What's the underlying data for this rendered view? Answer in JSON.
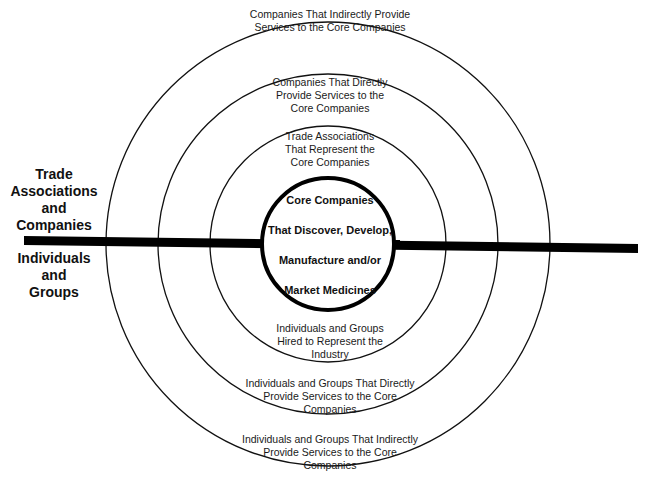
{
  "diagram": {
    "type": "concentric-circles",
    "center": [
      328,
      243
    ],
    "rings": [
      {
        "name": "outer",
        "radius": 222,
        "stroke": "#111111",
        "width": 1.3
      },
      {
        "name": "middle",
        "radius": 170,
        "stroke": "#111111",
        "width": 1.3
      },
      {
        "name": "inner",
        "radius": 118,
        "stroke": "#111111",
        "width": 1.3
      },
      {
        "name": "core",
        "radius": 66,
        "stroke": "#000000",
        "width": 4
      }
    ],
    "divider": {
      "x1": 24,
      "y1": 240,
      "x2": 638,
      "y2": 249,
      "stroke": "#000000",
      "width": 8
    },
    "core": {
      "lines": [
        "Core Companies",
        "That Discover, Develop,",
        "Manufacture and/or",
        "Market Medicines"
      ]
    },
    "top_labels": {
      "outer": [
        "Companies That Indirectly Provide",
        "Services to the Core Companies"
      ],
      "middle": [
        "Companies That Directly",
        "Provide Services to the",
        "Core Companies"
      ],
      "inner": [
        "Trade Associations",
        "That Represent the",
        "Core Companies"
      ]
    },
    "bottom_labels": {
      "inner": [
        "Individuals and Groups",
        "Hired to Represent the",
        "Industry"
      ],
      "middle": [
        "Individuals and Groups That Directly",
        "Provide Services to the Core",
        "Companies"
      ],
      "outer": [
        "Individuals and Groups That Indirectly",
        "Provide Services to the Core",
        "Companies"
      ]
    },
    "side_labels": {
      "top": [
        "Trade",
        "Associations",
        "and",
        "Companies"
      ],
      "bottom": [
        "Individuals",
        "and",
        "Groups"
      ]
    }
  }
}
